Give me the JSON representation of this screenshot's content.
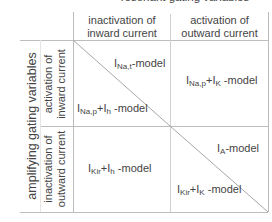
{
  "diagram": {
    "top_title": "resonant gating variables",
    "left_title": "amplifying gating variables",
    "columns": [
      {
        "line1": "inactivation of",
        "line2": "inward current"
      },
      {
        "line1": "activation of",
        "line2": "outward current"
      }
    ],
    "rows": [
      {
        "line1": "activation of",
        "line2": "inward current"
      },
      {
        "line1": "inactivation of",
        "line2": "outward current"
      }
    ],
    "cells": {
      "r1c1_upper": {
        "main": "I",
        "sub": "Na,t",
        "suffix": "-model"
      },
      "r1c1_lower": {
        "main": "I",
        "sub": "Na,p",
        "plus": "+I",
        "sub2": "h",
        "suffix": " -model"
      },
      "r1c2": {
        "main": "I",
        "sub": "Na,p",
        "plus": "+I",
        "sub2": "K",
        "suffix": " -model"
      },
      "r2c1": {
        "main": "I",
        "sub": "Kir",
        "plus": "+I",
        "sub2": "h",
        "suffix": " -model"
      },
      "r2c2_upper": {
        "main": "I",
        "sub": "A",
        "suffix": "-model"
      },
      "r2c2_lower": {
        "main": "I",
        "sub": "Kir",
        "plus": "+I",
        "sub2": "K",
        "suffix": " -model"
      }
    },
    "colors": {
      "grid_line": "#bbbbbb",
      "text": "#444444"
    }
  }
}
